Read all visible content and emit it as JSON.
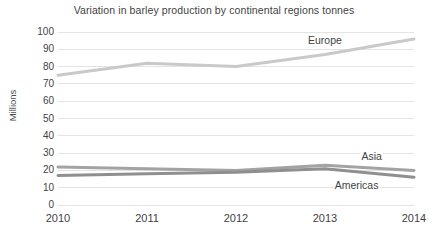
{
  "chart_data": {
    "type": "line",
    "title": "Variation in barley production by continental regions tonnes",
    "xlabel": "",
    "ylabel": "Millions",
    "categories": [
      "2010",
      "2011",
      "2012",
      "2013",
      "2014"
    ],
    "x": [
      2010,
      2011,
      2012,
      2013,
      2014
    ],
    "ylim": [
      0,
      100
    ],
    "ytick_step": 10,
    "yticks": [
      0,
      10,
      20,
      30,
      40,
      50,
      60,
      70,
      80,
      90,
      100
    ],
    "ytick_labels": [
      "0",
      "10",
      "20",
      "30",
      "40",
      "50",
      "60",
      "70",
      "80",
      "90",
      "100"
    ],
    "grid": true,
    "grid_axis": "y",
    "legend": "inline-labels",
    "legend_position": "none",
    "series": [
      {
        "name": "Europe",
        "values": [
          75,
          82,
          80,
          87,
          96
        ],
        "color": "#c9c9c9",
        "label_x": 2013,
        "label_y": 95
      },
      {
        "name": "Asia",
        "values": [
          22,
          21,
          20,
          23,
          20
        ],
        "color": "#a3a3a3",
        "label_x": 2013.6,
        "label_y": 28
      },
      {
        "name": "Americas",
        "values": [
          17,
          18,
          19,
          21,
          16
        ],
        "color": "#8f8f8f",
        "label_x": 2013.3,
        "label_y": 11
      }
    ]
  },
  "axis": {
    "y_title": "Millions",
    "y_labels": [
      "100",
      "90",
      "80",
      "70",
      "60",
      "50",
      "40",
      "30",
      "20",
      "10",
      "0"
    ],
    "x_labels": [
      "2010",
      "2011",
      "2012",
      "2013",
      "2014"
    ]
  },
  "series_labels": {
    "europe": "Europe",
    "asia": "Asia",
    "americas": "Americas"
  },
  "colors": {
    "background": "#ffffff",
    "gridline": "#e4e4e4",
    "axis_text": "#3f3f3f",
    "europe": "#c9c9c9",
    "asia": "#a3a3a3",
    "americas": "#8f8f8f"
  },
  "header": {
    "title": "Variation in barley production by continental regions tonnes"
  }
}
